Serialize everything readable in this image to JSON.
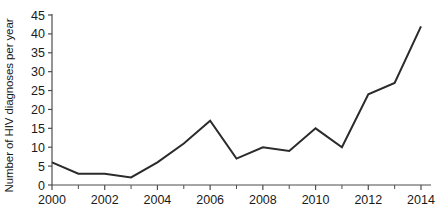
{
  "chart_data": {
    "type": "line",
    "title": "",
    "xlabel": "",
    "ylabel": "Number of HIV diagnoses per year",
    "x": [
      2000,
      2001,
      2002,
      2003,
      2004,
      2005,
      2006,
      2007,
      2008,
      2009,
      2010,
      2011,
      2012,
      2013,
      2014
    ],
    "values": [
      6,
      3,
      3,
      2,
      6,
      11,
      17,
      7,
      10,
      9,
      15,
      10,
      24,
      27,
      42
    ],
    "series": [
      {
        "name": "HIV diagnoses",
        "values": [
          6,
          3,
          3,
          2,
          6,
          11,
          17,
          7,
          10,
          9,
          15,
          10,
          24,
          27,
          42
        ]
      }
    ],
    "xlim": [
      2000,
      2014
    ],
    "ylim": [
      0,
      45
    ],
    "ytick_labels": [
      "0",
      "5",
      "10",
      "15",
      "20",
      "25",
      "30",
      "35",
      "40",
      "45"
    ],
    "ytick_values": [
      0,
      5,
      10,
      15,
      20,
      25,
      30,
      35,
      40,
      45
    ],
    "xtick_labels": [
      "2000",
      "2002",
      "2004",
      "2006",
      "2008",
      "2010",
      "2012",
      "2014"
    ],
    "xtick_values": [
      2000,
      2002,
      2004,
      2006,
      2008,
      2010,
      2012,
      2014
    ],
    "xminor_values": [
      2001,
      2003,
      2005,
      2007,
      2009,
      2011,
      2013
    ],
    "grid": false,
    "legend": "none",
    "markers": false,
    "line_color": "#2b2b2b",
    "axis_color": "#4d4d4d",
    "background_color": "#ffffff"
  }
}
